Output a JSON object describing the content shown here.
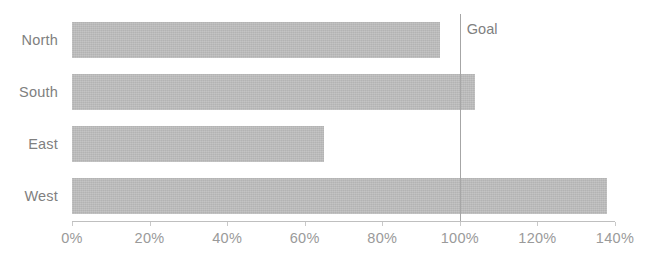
{
  "chart_data": {
    "type": "bar",
    "orientation": "horizontal",
    "title": "",
    "xlabel": "",
    "ylabel": "",
    "categories": [
      "North",
      "South",
      "East",
      "West"
    ],
    "values": [
      95,
      104,
      65,
      138
    ],
    "value_suffix": "%",
    "xlim": [
      0,
      140
    ],
    "x_ticks": [
      0,
      20,
      40,
      60,
      80,
      100,
      120,
      140
    ],
    "x_tick_labels": [
      "0%",
      "20%",
      "40%",
      "60%",
      "80%",
      "100%",
      "120%",
      "140%"
    ],
    "grid": false,
    "legend": "none",
    "annotations": [
      {
        "name": "goal-line",
        "label": "Goal",
        "value": 100,
        "type": "vertical-reference-line"
      }
    ],
    "series": [
      {
        "name": "Attainment",
        "values": [
          95,
          104,
          65,
          138
        ]
      }
    ]
  },
  "colors": {
    "bar_fill": "#b3b3b3",
    "goal_line": "#a6a6a6",
    "axis_line": "#bfbfbf",
    "tick_text": "#9a9a9a",
    "category_text": "#808080",
    "background": "#ffffff"
  }
}
